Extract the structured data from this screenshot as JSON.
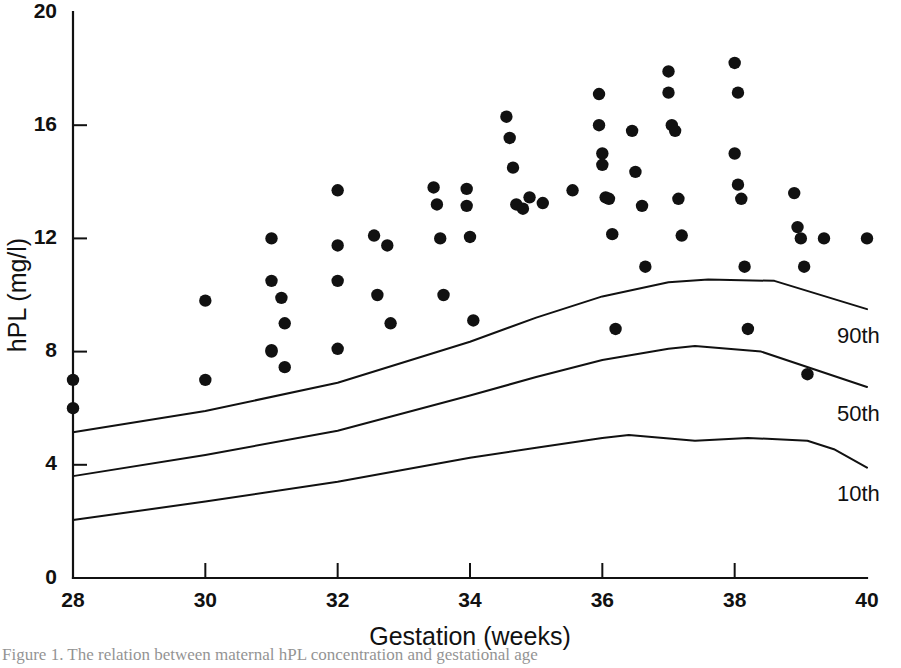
{
  "chart_data": {
    "type": "scatter",
    "title": "",
    "xlabel": "Gestation (weeks)",
    "ylabel": "hPL (mg/l)",
    "xlim": [
      28,
      40
    ],
    "ylim": [
      0,
      20
    ],
    "xticks": [
      28,
      30,
      32,
      34,
      36,
      38,
      40
    ],
    "xtick_labels": [
      "28",
      "30",
      "32",
      "34",
      "36",
      "38",
      "40"
    ],
    "yticks": [
      0,
      4,
      8,
      12,
      16,
      20
    ],
    "ytick_labels": [
      "0",
      "4",
      "8",
      "12",
      "16",
      "20"
    ],
    "grid": false,
    "legend_position": "right-inline",
    "marker": "filled-circle",
    "marker_color": "#111111",
    "line_color": "#111111",
    "points": [
      [
        28.0,
        7.0
      ],
      [
        28.0,
        6.0
      ],
      [
        30.0,
        9.8
      ],
      [
        30.0,
        7.0
      ],
      [
        31.0,
        12.0
      ],
      [
        31.0,
        10.5
      ],
      [
        31.0,
        8.05
      ],
      [
        31.0,
        8.0
      ],
      [
        31.15,
        9.9
      ],
      [
        31.2,
        9.0
      ],
      [
        31.2,
        7.45
      ],
      [
        32.0,
        13.7
      ],
      [
        32.0,
        11.75
      ],
      [
        32.0,
        10.5
      ],
      [
        32.0,
        8.1
      ],
      [
        32.55,
        12.1
      ],
      [
        32.6,
        10.0
      ],
      [
        32.75,
        11.75
      ],
      [
        32.8,
        9.0
      ],
      [
        33.45,
        13.8
      ],
      [
        33.5,
        13.2
      ],
      [
        33.55,
        12.0
      ],
      [
        33.6,
        10.0
      ],
      [
        33.95,
        13.75
      ],
      [
        33.95,
        13.15
      ],
      [
        34.0,
        12.05
      ],
      [
        34.05,
        9.1
      ],
      [
        34.55,
        16.3
      ],
      [
        34.6,
        15.55
      ],
      [
        34.65,
        14.5
      ],
      [
        34.7,
        13.2
      ],
      [
        34.8,
        13.05
      ],
      [
        34.9,
        13.45
      ],
      [
        35.1,
        13.25
      ],
      [
        35.55,
        13.7
      ],
      [
        35.95,
        17.1
      ],
      [
        35.95,
        16.0
      ],
      [
        36.0,
        15.0
      ],
      [
        36.0,
        14.6
      ],
      [
        36.05,
        13.45
      ],
      [
        36.1,
        13.4
      ],
      [
        36.15,
        12.15
      ],
      [
        36.2,
        8.8
      ],
      [
        36.45,
        15.8
      ],
      [
        36.5,
        14.35
      ],
      [
        36.6,
        13.15
      ],
      [
        36.65,
        11.0
      ],
      [
        37.0,
        17.9
      ],
      [
        37.0,
        17.15
      ],
      [
        37.05,
        16.0
      ],
      [
        37.1,
        15.8
      ],
      [
        37.15,
        13.4
      ],
      [
        37.2,
        12.1
      ],
      [
        38.0,
        18.2
      ],
      [
        38.05,
        17.15
      ],
      [
        38.0,
        15.0
      ],
      [
        38.05,
        13.9
      ],
      [
        38.1,
        13.4
      ],
      [
        38.15,
        11.0
      ],
      [
        38.2,
        8.8
      ],
      [
        38.9,
        13.6
      ],
      [
        38.95,
        12.4
      ],
      [
        39.0,
        12.0
      ],
      [
        39.05,
        11.0
      ],
      [
        39.1,
        7.2
      ],
      [
        39.35,
        12.0
      ],
      [
        40.0,
        12.0
      ]
    ],
    "series": [
      {
        "name": "90th",
        "label": "90th",
        "x": [
          28,
          30,
          32,
          34,
          35,
          36,
          37,
          37.6,
          38.6,
          40
        ],
        "values": [
          5.15,
          5.9,
          6.9,
          8.35,
          9.2,
          9.95,
          10.45,
          10.55,
          10.5,
          9.5
        ]
      },
      {
        "name": "50th",
        "label": "50th",
        "x": [
          28,
          30,
          32,
          34,
          35,
          36,
          37,
          37.4,
          38.4,
          40
        ],
        "values": [
          3.6,
          4.35,
          5.2,
          6.45,
          7.1,
          7.7,
          8.1,
          8.2,
          8.0,
          6.75
        ]
      },
      {
        "name": "10th",
        "label": "10th",
        "x": [
          28,
          30,
          32,
          34,
          35,
          36,
          36.4,
          37.4,
          38.2,
          39.1,
          39.5,
          40
        ],
        "values": [
          2.05,
          2.7,
          3.4,
          4.25,
          4.6,
          4.95,
          5.05,
          4.85,
          4.95,
          4.85,
          4.55,
          3.9
        ]
      }
    ]
  },
  "caption": {
    "text": "Figure 1.  The relation between maternal hPL concentration and gestational age"
  }
}
